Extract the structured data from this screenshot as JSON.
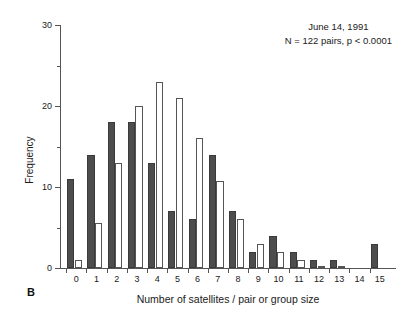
{
  "panel": {
    "label": "B"
  },
  "annotation": {
    "line1": "June 14, 1991",
    "line2": "N = 122 pairs, p < 0.0001"
  },
  "axes": {
    "y_title": "Frequency",
    "x_title": "Number of satellites / pair or group size",
    "y_major_ticks": [
      "0",
      "10",
      "20",
      "30"
    ],
    "y_minor_ticks": [
      "5",
      "15",
      "25"
    ],
    "x_tick_labels": [
      "0",
      "1",
      "2",
      "3",
      "4",
      "5",
      "6",
      "7",
      "8",
      "9",
      "10",
      "11",
      "12",
      "13",
      "14",
      "15"
    ]
  },
  "colors": {
    "series_dark": "#4d4d4d",
    "series_light": "#ffffff",
    "outline": "#555555",
    "axis": "#555555",
    "text": "#1a1a1a",
    "background": "#ffffff"
  },
  "chart_data": {
    "type": "bar",
    "title": "",
    "subtitle": "June 14, 1991",
    "annotation": "N = 122 pairs, p < 0.0001",
    "xlabel": "Number of satellites / pair or group size",
    "ylabel": "Frequency",
    "categories": [
      "0",
      "1",
      "2",
      "3",
      "4",
      "5",
      "6",
      "7",
      "8",
      "9",
      "10",
      "11",
      "12",
      "13",
      "14",
      "15"
    ],
    "series": [
      {
        "name": "observed",
        "style": "filled-dark",
        "color": "#4d4d4d",
        "values": [
          11,
          14,
          18,
          18,
          13,
          7,
          6,
          14,
          7,
          2,
          4,
          2,
          1,
          1,
          0,
          3
        ]
      },
      {
        "name": "expected",
        "style": "open-white",
        "color": "#ffffff",
        "values": [
          1,
          5.5,
          13,
          20,
          23,
          21,
          16,
          10.7,
          6,
          3,
          2,
          1,
          0.3,
          0.2,
          0,
          0
        ]
      }
    ],
    "ylim": [
      0,
      30
    ],
    "ytick_major": [
      0,
      10,
      20,
      30
    ],
    "ytick_minor": [
      5,
      15,
      25
    ],
    "xlim": [
      -0.5,
      15.5
    ],
    "grid": false,
    "legend": "none"
  }
}
